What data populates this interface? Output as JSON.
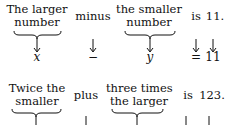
{
  "rows": [
    {
      "phrases": [
        "The larger\nnumber",
        "minus",
        "the smaller\nnumber",
        "is",
        "11."
      ],
      "symbols": [
        "x",
        "−",
        "y",
        "=",
        "11"
      ]
    },
    {
      "phrases": [
        "Twice the\nsmaller",
        "plus",
        "three times\nthe larger",
        "is",
        "123."
      ],
      "symbols": []
    }
  ],
  "r1": {
    "p1a": "The larger",
    "p1b": "number",
    "p2": "minus",
    "p3a": "the smaller",
    "p3b": "number",
    "p4": "is",
    "p5": "11.",
    "s1": "x",
    "s2": "−",
    "s3": "y",
    "s4": "=",
    "s5": "11"
  },
  "r2": {
    "p1a": "Twice the",
    "p1b": "smaller",
    "p2": "plus",
    "p3a": "three times",
    "p3b": "the larger",
    "p4": "is",
    "p5": "123."
  }
}
